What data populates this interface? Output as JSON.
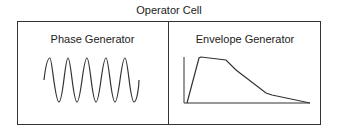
{
  "diagram": {
    "title": "Operator Cell",
    "panels": [
      {
        "label": "Phase Generator",
        "graphic": "sine-wave",
        "cycles": 5
      },
      {
        "label": "Envelope Generator",
        "graphic": "envelope-curve"
      }
    ],
    "line_color": "#333333"
  }
}
